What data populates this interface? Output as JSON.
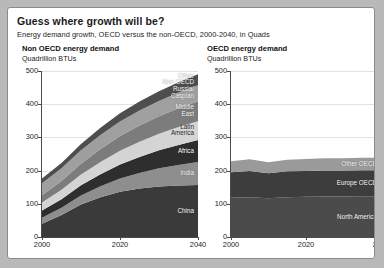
{
  "card": {
    "title": "Guess where growth will be?",
    "subtitle": "Energy demand growth, OECD versus the non-OECD, 2000-2040, in Quads"
  },
  "panels": {
    "left": {
      "header": "Non OECD energy demand",
      "unit": "Quadrillion BTUs"
    },
    "right": {
      "header": "OECD energy demand",
      "unit": "Quadrillion BTUs"
    }
  },
  "axes": {
    "yticks": [
      "0",
      "100",
      "200",
      "300",
      "400",
      "500"
    ],
    "xticks": [
      "2000",
      "2020",
      "2040"
    ]
  },
  "chart_data": [
    {
      "type": "area",
      "id": "non-oecd",
      "title": "Non OECD energy demand",
      "subtitle": "Quadrillion BTUs",
      "xlabel": "",
      "ylabel": "Quadrillion BTUs",
      "stacked": true,
      "grid": true,
      "legend": "inline-band-labels",
      "xlim": [
        2000,
        2040
      ],
      "ylim": [
        0,
        500
      ],
      "yticks": [
        0,
        100,
        200,
        300,
        400,
        500
      ],
      "xticks": [
        2000,
        2020,
        2040
      ],
      "x": [
        2000,
        2005,
        2010,
        2015,
        2020,
        2025,
        2030,
        2035,
        2040
      ],
      "series": [
        {
          "name": "China",
          "color": "#3a3a3a",
          "values": [
            40,
            66,
            98,
            120,
            136,
            146,
            152,
            155,
            157
          ]
        },
        {
          "name": "India",
          "color": "#8e8e8e",
          "values": [
            18,
            22,
            27,
            33,
            40,
            47,
            55,
            62,
            69
          ]
        },
        {
          "name": "Africa",
          "color": "#2e2e2e",
          "values": [
            22,
            26,
            31,
            36,
            42,
            48,
            54,
            60,
            66
          ]
        },
        {
          "name": "Latin\nAmerica",
          "color": "#d4d4d4",
          "values": [
            24,
            28,
            32,
            37,
            42,
            46,
            50,
            54,
            57
          ]
        },
        {
          "name": "Middle\nEast",
          "color": "#7c7c7c",
          "values": [
            22,
            27,
            33,
            39,
            44,
            49,
            53,
            57,
            60
          ]
        },
        {
          "name": "Russia/\nCaspian",
          "color": "#9f9f9f",
          "values": [
            36,
            38,
            40,
            42,
            44,
            45,
            46,
            47,
            48
          ]
        },
        {
          "name": "Other\nNon OECD",
          "color": "#4e4e4e",
          "values": [
            14,
            16,
            19,
            22,
            25,
            27,
            29,
            31,
            33
          ]
        }
      ],
      "totals": [
        176,
        223,
        280,
        329,
        373,
        408,
        439,
        466,
        490
      ]
    },
    {
      "type": "area",
      "id": "oecd",
      "title": "OECD energy demand",
      "subtitle": "Quadrillion BTUs",
      "xlabel": "",
      "ylabel": "Quadrillion BTUs",
      "stacked": true,
      "grid": true,
      "legend": "inline-band-labels",
      "xlim": [
        2000,
        2040
      ],
      "ylim": [
        0,
        500
      ],
      "yticks": [
        0,
        100,
        200,
        300,
        400,
        500
      ],
      "xticks": [
        2000,
        2020,
        2040
      ],
      "x": [
        2000,
        2005,
        2010,
        2015,
        2020,
        2025,
        2030,
        2035,
        2040
      ],
      "series": [
        {
          "name": "North America",
          "color": "#4b4b4b",
          "values": [
            118,
            120,
            117,
            120,
            121,
            122,
            122,
            123,
            123
          ]
        },
        {
          "name": "Europe OECD",
          "color": "#3d3d3d",
          "values": [
            77,
            79,
            75,
            78,
            78,
            78,
            78,
            78,
            78
          ]
        },
        {
          "name": "Other OECD",
          "color": "#9a9a9a",
          "values": [
            33,
            35,
            33,
            35,
            36,
            37,
            37,
            38,
            38
          ]
        }
      ],
      "totals": [
        228,
        234,
        225,
        233,
        235,
        237,
        237,
        239,
        239
      ]
    }
  ]
}
